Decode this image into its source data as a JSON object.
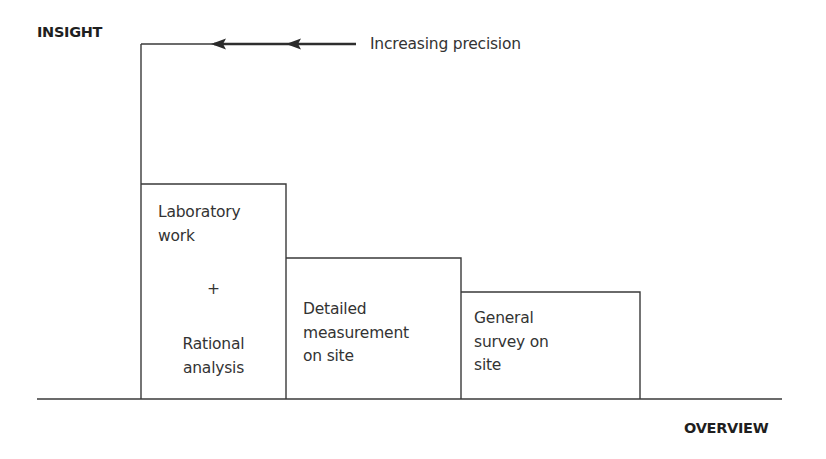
{
  "diagram": {
    "y_axis_label": "INSIGHT",
    "x_axis_label": "OVERVIEW",
    "arrow_annotation": "Increasing precision",
    "arrow_direction": "left",
    "line_color": "#3a3a3a",
    "text_color": "#333333",
    "steps": [
      {
        "id": "laboratory",
        "lines": [
          "Laboratory",
          "work"
        ],
        "connector": "+",
        "lines_bottom": [
          "Rational",
          "analysis"
        ],
        "level": "highest"
      },
      {
        "id": "detailed",
        "lines": [
          "Detailed",
          "measurement",
          "on site"
        ],
        "level": "middle"
      },
      {
        "id": "general",
        "lines": [
          "General",
          "survey on",
          "site"
        ],
        "level": "lowest"
      }
    ]
  }
}
